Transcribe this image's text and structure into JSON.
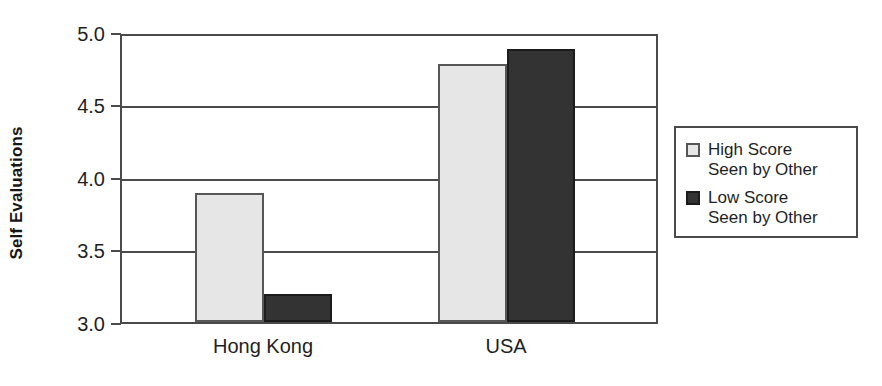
{
  "chart_data": {
    "type": "bar",
    "title": "",
    "xlabel": "",
    "ylabel": "Self Evaluations",
    "categories": [
      "Hong Kong",
      "USA"
    ],
    "series": [
      {
        "name": "High Score\nSeen by Other",
        "values": [
          3.89,
          4.78
        ],
        "color": "#e6e6e6"
      },
      {
        "name": "Low Score\nSeen by Other",
        "values": [
          3.19,
          4.88
        ],
        "color": "#333333"
      }
    ],
    "ylim": [
      3.0,
      5.0
    ],
    "ytick_labels": [
      "5.0",
      "4.5",
      "4.0",
      "3.5",
      "3.0"
    ],
    "ytick_values": [
      5.0,
      4.5,
      4.0,
      3.5,
      3.0
    ],
    "grid": true,
    "legend_position": "right-outside"
  },
  "legend": {
    "entries": [
      {
        "label": "High Score\nSeen by Other",
        "swatch": "light-gray-swatch-icon"
      },
      {
        "label": "Low Score\nSeen by Other",
        "swatch": "dark-gray-swatch-icon"
      }
    ]
  }
}
